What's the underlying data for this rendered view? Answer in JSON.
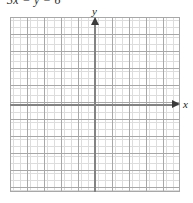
{
  "figure": {
    "equation": "3x − y = 6",
    "background_color": "#ffffff"
  },
  "axes": {
    "x_label": "x",
    "y_label": "y",
    "axis_color": "#838383",
    "arrow_color": "#3a3a3a",
    "grid_minor_color": "#c9c9c9",
    "grid_major_color": "#a8a8a8"
  },
  "chart_data": {
    "type": "line",
    "title": "3x − y = 6",
    "xlabel": "x",
    "ylabel": "y",
    "grid": true,
    "legend": "none",
    "xlim": [
      -5,
      5
    ],
    "ylim": [
      -5,
      5
    ],
    "x_major_ticks": [
      -5,
      -4,
      -3,
      -2,
      -1,
      0,
      1,
      2,
      3,
      4,
      5
    ],
    "y_major_ticks": [
      -5,
      -4,
      -3,
      -2,
      -1,
      0,
      1,
      2,
      3,
      4,
      5
    ],
    "minor_grid_per_major": 5,
    "series": [
      {
        "name": "3x - y = 6",
        "values": [],
        "note": "blank grid — no curve plotted"
      }
    ],
    "annotations": []
  }
}
